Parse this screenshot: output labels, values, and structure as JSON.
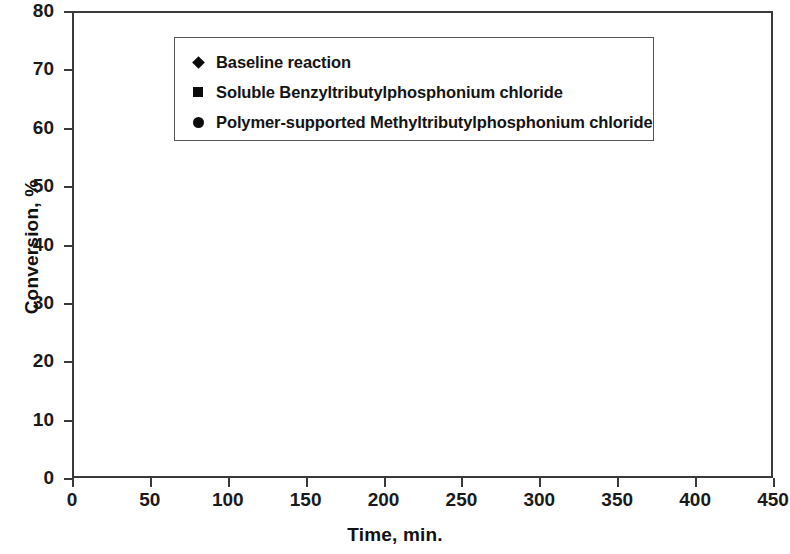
{
  "chart_data": {
    "type": "scatter",
    "title": "",
    "xlabel": "Time, min.",
    "ylabel": "Conversion, %",
    "xlim": [
      0,
      450
    ],
    "ylim": [
      0,
      80
    ],
    "xticks": [
      0,
      50,
      100,
      150,
      200,
      250,
      300,
      350,
      400,
      450
    ],
    "yticks": [
      0,
      10,
      20,
      30,
      40,
      50,
      60,
      70,
      80
    ],
    "grid": false,
    "legend_position": "top-left-inside",
    "marker_color": "#0b0b0b",
    "series": [
      {
        "name": "Baseline reaction",
        "marker": "diamond",
        "x": [
          30,
          60,
          120,
          150,
          180,
          240,
          300,
          360,
          420
        ],
        "y": [
          2.0,
          4.6,
          9.4,
          11.9,
          13.9,
          18.3,
          22.0,
          26.0,
          29.5
        ]
      },
      {
        "name": "Soluble Benzyltributylphosphonium chloride",
        "marker": "square",
        "x": [
          30,
          60,
          90,
          120,
          150,
          180,
          240,
          300,
          360,
          420
        ],
        "y": [
          2.3,
          5.0,
          7.0,
          9.6,
          12.3,
          14.2,
          19.2,
          26.3,
          28.9,
          36.5
        ]
      },
      {
        "name": "Polymer-supported Methyltributylphosphonium chloride",
        "marker": "circle",
        "x": [
          30,
          60,
          90,
          120,
          150,
          180,
          240,
          360,
          420
        ],
        "y": [
          7.6,
          17.5,
          23.5,
          31.2,
          33.5,
          38.0,
          46.0,
          62.2,
          68.0
        ]
      }
    ]
  },
  "axes": {
    "x_title": "Time, min.",
    "y_title": "Conversion, %",
    "x_tick_labels": [
      "0",
      "50",
      "100",
      "150",
      "200",
      "250",
      "300",
      "350",
      "400",
      "450"
    ],
    "y_tick_labels": [
      "0",
      "10",
      "20",
      "30",
      "40",
      "50",
      "60",
      "70",
      "80"
    ]
  },
  "legend": {
    "entries": [
      {
        "marker": "diamond",
        "label": "Baseline reaction"
      },
      {
        "marker": "square",
        "label": "Soluble Benzyltributylphosphonium chloride"
      },
      {
        "marker": "circle",
        "label": "Polymer-supported Methyltributylphosphonium chloride"
      }
    ]
  }
}
